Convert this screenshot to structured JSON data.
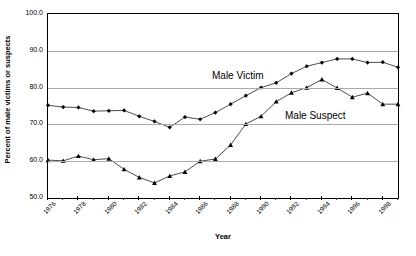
{
  "chart_data": {
    "type": "line",
    "title": "",
    "xlabel": "Year",
    "ylabel": "Percent of male victims or suspects",
    "xlim": [
      1976,
      1999
    ],
    "ylim": [
      50.0,
      100.0
    ],
    "yticks": [
      "100.0",
      "90.0",
      "80.0",
      "70.0",
      "60.0",
      "50.0"
    ],
    "ytick_values": [
      100.0,
      90.0,
      80.0,
      70.0,
      60.0,
      50.0
    ],
    "grid": "horizontal",
    "legend_position": "inline-annotation",
    "x": [
      1976,
      1977,
      1978,
      1979,
      1980,
      1981,
      1982,
      1983,
      1984,
      1985,
      1986,
      1987,
      1988,
      1989,
      1990,
      1991,
      1992,
      1993,
      1994,
      1995,
      1996,
      1997,
      1998,
      1999
    ],
    "xtick_labels": [
      "1976",
      "1978",
      "1980",
      "1982",
      "1984",
      "1986",
      "1988",
      "1990",
      "1992",
      "1994",
      "1996",
      "1998"
    ],
    "xtick_values": [
      1976,
      1978,
      1980,
      1982,
      1984,
      1986,
      1988,
      1990,
      1992,
      1994,
      1996,
      1998
    ],
    "series": [
      {
        "name": "Male Victim",
        "marker": "diamond",
        "color": "#000000",
        "values": [
          75.2,
          74.7,
          74.6,
          73.6,
          73.7,
          73.8,
          72.2,
          70.8,
          69.2,
          72.0,
          71.4,
          73.2,
          75.5,
          77.8,
          80.0,
          81.3,
          83.8,
          85.8,
          86.8,
          87.8,
          87.8,
          86.8,
          86.9,
          85.5
        ]
      },
      {
        "name": "Male Suspect",
        "marker": "triangle",
        "color": "#000000",
        "values": [
          60.3,
          60.1,
          61.4,
          60.4,
          60.7,
          57.8,
          55.6,
          54.1,
          56.0,
          57.1,
          60.0,
          60.6,
          64.4,
          70.1,
          72.2,
          76.2,
          78.6,
          80.0,
          82.2,
          79.9,
          77.4,
          78.5,
          75.5,
          75.5
        ]
      }
    ],
    "annotations": [
      {
        "text": "Male Victim",
        "x_px": 212,
        "y_px": 70
      },
      {
        "text": "Male Suspect",
        "x_px": 285,
        "y_px": 110
      }
    ]
  },
  "colors": {
    "axis": "#000000",
    "grid": "#a9a9a9",
    "background": "#ffffff",
    "series": "#000000"
  }
}
